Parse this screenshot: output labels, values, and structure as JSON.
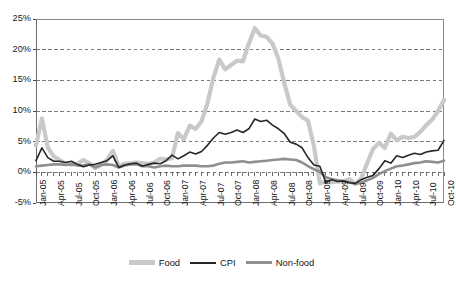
{
  "chart_data": {
    "type": "line",
    "title": "",
    "xlabel": "",
    "ylabel": "",
    "ylim": [
      -5,
      25
    ],
    "ytick_labels": [
      "25%",
      "20%",
      "15%",
      "10%",
      "5%",
      "0%",
      "-5%"
    ],
    "ytick_values": [
      25,
      20,
      15,
      10,
      5,
      0,
      -5
    ],
    "grid": "horizontal dashed gridlines at 20%, 15%, 10%, 5%, 0%",
    "legend_position": "bottom-center",
    "x_tick_interval": "quarterly",
    "x_labels": [
      "Jan-05",
      "Apr-05",
      "Jul-05",
      "Oct-05",
      "Jan-06",
      "Apr-06",
      "Jul-06",
      "Oct-06",
      "Jan-07",
      "Apr-07",
      "Jul-07",
      "Oct-07",
      "Jan-08",
      "Apr-08",
      "Jul-08",
      "Oct-08",
      "Jan-09",
      "Apr-09",
      "Jul-09",
      "Oct-09",
      "Jan-10",
      "Apr-10",
      "Jul-10",
      "Oct-10"
    ],
    "x": [
      "Jan-05",
      "Feb-05",
      "Mar-05",
      "Apr-05",
      "May-05",
      "Jun-05",
      "Jul-05",
      "Aug-05",
      "Sep-05",
      "Oct-05",
      "Nov-05",
      "Dec-05",
      "Jan-06",
      "Feb-06",
      "Mar-06",
      "Apr-06",
      "May-06",
      "Jun-06",
      "Jul-06",
      "Aug-06",
      "Sep-06",
      "Oct-06",
      "Nov-06",
      "Dec-06",
      "Jan-07",
      "Feb-07",
      "Mar-07",
      "Apr-07",
      "May-07",
      "Jun-07",
      "Jul-07",
      "Aug-07",
      "Sep-07",
      "Oct-07",
      "Nov-07",
      "Dec-07",
      "Jan-08",
      "Feb-08",
      "Mar-08",
      "Apr-08",
      "May-08",
      "Jun-08",
      "Jul-08",
      "Aug-08",
      "Sep-08",
      "Oct-08",
      "Nov-08",
      "Dec-08",
      "Jan-09",
      "Feb-09",
      "Mar-09",
      "Apr-09",
      "May-09",
      "Jun-09",
      "Jul-09",
      "Aug-09",
      "Sep-09",
      "Oct-09",
      "Nov-09",
      "Dec-09",
      "Jan-10",
      "Feb-10",
      "Mar-10",
      "Apr-10",
      "May-10",
      "Jun-10",
      "Jul-10",
      "Aug-10",
      "Sep-10",
      "Oct-10"
    ],
    "series": [
      {
        "name": "Food",
        "color": "#c9c9c9",
        "width": 4.2,
        "values": [
          4.4,
          8.8,
          4.0,
          2.6,
          2.0,
          1.4,
          1.3,
          1.4,
          2.0,
          1.5,
          0.7,
          1.2,
          2.0,
          3.5,
          1.0,
          1.4,
          1.5,
          1.6,
          1.5,
          1.4,
          1.6,
          2.2,
          2.1,
          2.3,
          6.4,
          5.4,
          7.6,
          7.1,
          8.3,
          11.3,
          15.4,
          18.4,
          16.8,
          17.5,
          18.2,
          18.1,
          21.0,
          23.5,
          22.3,
          22.1,
          21.0,
          18.5,
          14.5,
          11.0,
          10.0,
          9.0,
          8.4,
          4.3,
          -1.8,
          -1.5,
          -1.6,
          -1.5,
          -1.5,
          -1.1,
          -1.9,
          -1.0,
          1.5,
          3.8,
          4.8,
          4.0,
          6.3,
          5.2,
          5.8,
          5.6,
          5.8,
          6.6,
          7.7,
          8.6,
          10.0,
          11.8
        ]
      },
      {
        "name": "CPI",
        "color": "#262626",
        "width": 1.6,
        "values": [
          1.9,
          4.0,
          2.4,
          1.8,
          1.8,
          1.6,
          1.8,
          1.3,
          0.9,
          1.2,
          1.3,
          1.6,
          1.9,
          2.7,
          0.8,
          1.2,
          1.4,
          1.5,
          1.0,
          1.3,
          1.5,
          1.4,
          1.9,
          2.8,
          2.2,
          2.7,
          3.3,
          3.0,
          3.4,
          4.4,
          5.6,
          6.5,
          6.2,
          6.5,
          6.9,
          6.5,
          7.1,
          8.7,
          8.3,
          8.5,
          7.7,
          7.1,
          6.3,
          4.9,
          4.6,
          4.0,
          2.4,
          1.2,
          1.0,
          -1.6,
          -1.2,
          -1.5,
          -1.4,
          -1.7,
          -1.8,
          -1.2,
          -0.8,
          -0.5,
          0.6,
          1.9,
          1.5,
          2.7,
          2.4,
          2.8,
          3.1,
          2.9,
          3.3,
          3.5,
          3.6,
          5.2
        ]
      },
      {
        "name": "Non-food",
        "color": "#8f8f8f",
        "width": 2.6,
        "values": [
          1.0,
          1.1,
          1.2,
          1.3,
          1.3,
          1.2,
          1.3,
          1.1,
          1.1,
          1.3,
          0.8,
          1.2,
          1.3,
          1.2,
          0.8,
          1.1,
          1.3,
          1.3,
          1.0,
          1.0,
          0.8,
          1.0,
          1.1,
          1.0,
          1.0,
          1.1,
          1.1,
          1.1,
          1.0,
          1.0,
          1.1,
          1.4,
          1.6,
          1.6,
          1.7,
          1.8,
          1.6,
          1.7,
          1.8,
          1.9,
          2.0,
          2.1,
          2.2,
          2.1,
          2.0,
          1.6,
          1.0,
          0.5,
          0.1,
          -0.8,
          -1.1,
          -1.3,
          -1.4,
          -1.6,
          -1.9,
          -1.7,
          -1.3,
          -0.9,
          -0.3,
          0.2,
          0.6,
          1.0,
          1.1,
          1.3,
          1.5,
          1.6,
          1.8,
          1.7,
          1.6,
          1.9
        ]
      }
    ]
  },
  "legend": {
    "items": [
      {
        "label": "Food"
      },
      {
        "label": "CPI"
      },
      {
        "label": "Non-food"
      }
    ]
  }
}
